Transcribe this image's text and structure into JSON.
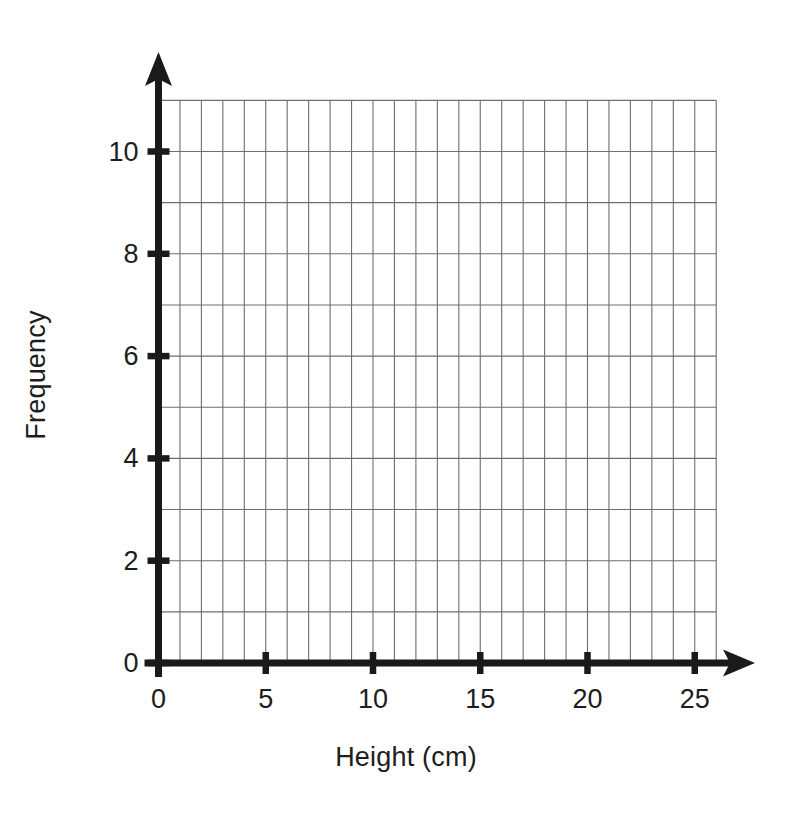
{
  "chart_data": {
    "type": "bar",
    "title": "",
    "subtitle": "",
    "xlabel": "Height (cm)",
    "ylabel": "Frequency",
    "categories": [],
    "values": [],
    "series": [],
    "annotations": [],
    "legend": [],
    "legend_position": "none",
    "grid": true,
    "grid_description": "1 unit by 1 unit graph-paper grid, blank plotting area",
    "xlim": [
      0,
      26
    ],
    "ylim": [
      0,
      11
    ],
    "x_ticks": [
      0,
      5,
      10,
      15,
      20,
      25
    ],
    "x_tick_labels": [
      "0",
      "5",
      "10",
      "15",
      "20",
      "25"
    ],
    "x_tick_interval": 5,
    "x_gridline_interval": 1,
    "y_ticks": [
      0,
      2,
      4,
      6,
      8,
      10
    ],
    "y_tick_labels": [
      "0",
      "2",
      "4",
      "6",
      "8",
      "10"
    ],
    "y_tick_interval": 2,
    "y_gridline_interval": 1,
    "axis_style": "arrow-tipped",
    "colors": {
      "background": "#ffffff",
      "axis": "#1a1a1a",
      "gridline": "#6e6e6e",
      "text": "#1d1d1d"
    }
  },
  "axes": {
    "x_title": "Height (cm)",
    "y_title": "Frequency"
  }
}
